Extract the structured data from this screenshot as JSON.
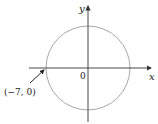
{
  "diagram": {
    "type": "circle-on-axes",
    "axes": {
      "x_label": "x",
      "y_label": "y",
      "origin_label": "0"
    },
    "circle": {
      "center": [
        0,
        0
      ],
      "radius": 7,
      "stroke_color": "#a0a0a0"
    },
    "annotation": {
      "point_label": "(−7, 0)",
      "point": [
        -7,
        0
      ]
    },
    "colors": {
      "axis": "#333333",
      "circle": "#a0a0a0",
      "text": "#222222"
    }
  }
}
